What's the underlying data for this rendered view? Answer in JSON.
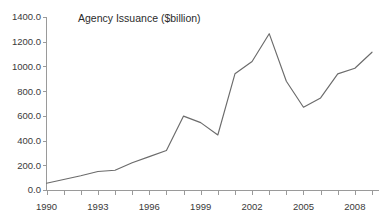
{
  "chart_data": {
    "type": "line",
    "title": "Agency Issuance ($billion)",
    "xlabel": "",
    "ylabel": "",
    "grid": false,
    "legend": "none",
    "xlim": [
      1990,
      2009
    ],
    "ylim": [
      0,
      1400
    ],
    "y_tick_values": [
      0,
      200,
      400,
      600,
      800,
      1000,
      1200,
      1400
    ],
    "y_tick_labels": [
      "0.0",
      "200.0",
      "400.0",
      "600.0",
      "800.0",
      "1000.0",
      "1200.0",
      "1400.0"
    ],
    "x_tick_values": [
      1990,
      1993,
      1996,
      1999,
      2002,
      2005,
      2008
    ],
    "x_tick_labels": [
      "1990",
      "1993",
      "1996",
      "1999",
      "2002",
      "2005",
      "2008"
    ],
    "x_minor_ticks": [
      1990,
      1991,
      1992,
      1993,
      1994,
      1995,
      1996,
      1997,
      1998,
      1999,
      2000,
      2001,
      2002,
      2003,
      2004,
      2005,
      2006,
      2007,
      2008,
      2009
    ],
    "x": [
      1990,
      1991,
      1992,
      1993,
      1994,
      1995,
      1996,
      1997,
      1998,
      1999,
      2000,
      2001,
      2002,
      2003,
      2004,
      2005,
      2006,
      2007,
      2008,
      2009
    ],
    "values": [
      55,
      85,
      115,
      150,
      160,
      220,
      270,
      320,
      598,
      545,
      445,
      940,
      1040,
      1265,
      880,
      670,
      745,
      940,
      985,
      1115
    ],
    "series_name": "Agency Issuance",
    "series_color": "#6b6b6b",
    "axis_color": "#9a9a9a",
    "text_color": "#3a3a3a"
  },
  "chart": {
    "title": "Agency Issuance ($billion)"
  }
}
